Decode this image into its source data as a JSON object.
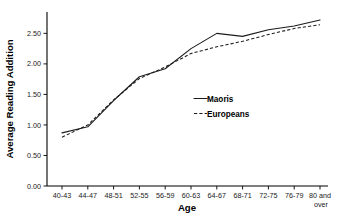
{
  "chart_data": {
    "type": "line",
    "title": "",
    "xlabel": "Age",
    "ylabel": "Average Reading Addition",
    "categories": [
      "40-43",
      "44-47",
      "48-51",
      "52-55",
      "56-59",
      "60-63",
      "64-67",
      "68-71",
      "72-75",
      "76-79",
      "80 and over"
    ],
    "series": [
      {
        "name": "Maoris",
        "style": "solid",
        "values": [
          0.87,
          0.97,
          1.4,
          1.79,
          1.92,
          2.25,
          2.5,
          2.45,
          2.56,
          2.62,
          2.72
        ]
      },
      {
        "name": "Europeans",
        "style": "dashed",
        "values": [
          0.8,
          1.0,
          1.41,
          1.76,
          1.95,
          2.17,
          2.28,
          2.37,
          2.48,
          2.58,
          2.64
        ]
      }
    ],
    "ylim": [
      0.0,
      2.85
    ],
    "yticks": [
      0.0,
      0.5,
      1.0,
      1.5,
      2.0,
      2.5
    ],
    "ytick_labels": [
      "0.00",
      "0.50",
      "1.00",
      "1.50",
      "2.00",
      "2.50"
    ],
    "grid": false,
    "legend_position": "center-right"
  },
  "axes": {
    "y_title": "Average Reading Addition",
    "x_title": "Age"
  },
  "legend": {
    "entries": [
      {
        "label": "Maoris",
        "sample": "solid-line-swatch"
      },
      {
        "label": "Europeans",
        "sample": "dashed-line-swatch"
      }
    ]
  },
  "xtick_labels": [
    {
      "line1": "40-43",
      "line2": ""
    },
    {
      "line1": "44-47",
      "line2": ""
    },
    {
      "line1": "48-51",
      "line2": ""
    },
    {
      "line1": "52-55",
      "line2": ""
    },
    {
      "line1": "56-59",
      "line2": ""
    },
    {
      "line1": "60-63",
      "line2": ""
    },
    {
      "line1": "64-67",
      "line2": ""
    },
    {
      "line1": "68-71",
      "line2": ""
    },
    {
      "line1": "72-75",
      "line2": ""
    },
    {
      "line1": "76-79",
      "line2": ""
    },
    {
      "line1": "80 and",
      "line2": "over"
    }
  ],
  "ytick_labels": [
    "0.00",
    "0.50",
    "1.00",
    "1.50",
    "2.00",
    "2.50"
  ],
  "colors": {
    "line": "#1c1c1c",
    "axis": "#000000",
    "background": "#ffffff"
  }
}
